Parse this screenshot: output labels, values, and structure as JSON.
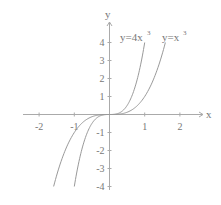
{
  "chart_data": {
    "type": "line",
    "title": "",
    "xlabel": "x",
    "ylabel": "y",
    "xlim": [
      -2.5,
      2.6
    ],
    "ylim": [
      -4.2,
      4.6
    ],
    "x_ticks": [
      "-2",
      "-1",
      "1",
      "2"
    ],
    "y_ticks": [
      "4",
      "3",
      "2",
      "1",
      "-1",
      "-2",
      "-3",
      "-4"
    ],
    "grid": false,
    "series": [
      {
        "name": "y=4x^3",
        "label": "y=4x",
        "exp": "3",
        "function": "4*x^3",
        "x_range": [
          -1,
          1
        ]
      },
      {
        "name": "y=x^3",
        "label": "y=x",
        "exp": "3",
        "function": "x^3",
        "x_range": [
          -1.587,
          1.587
        ]
      }
    ]
  },
  "colors": {
    "axis": "#999999",
    "curve": "#999999",
    "text": "#777777"
  }
}
